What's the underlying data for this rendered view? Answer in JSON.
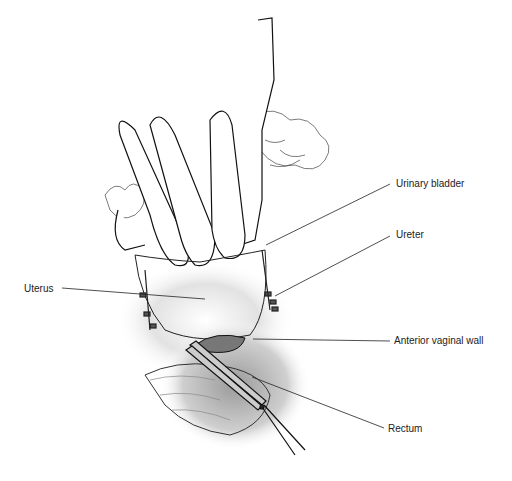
{
  "figure": {
    "labels": [
      {
        "id": "urinary-bladder",
        "text": "Urinary bladder",
        "x": 396,
        "y": 178
      },
      {
        "id": "ureter",
        "text": "Ureter",
        "x": 396,
        "y": 229
      },
      {
        "id": "uterus",
        "text": "Uterus",
        "x": 24,
        "y": 285
      },
      {
        "id": "anterior-vaginal-wall",
        "text": "Anterior vaginal wall",
        "x": 394,
        "y": 335
      },
      {
        "id": "rectum",
        "text": "Rectum",
        "x": 388,
        "y": 425
      }
    ]
  }
}
